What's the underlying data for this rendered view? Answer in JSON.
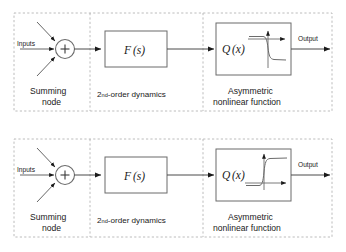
{
  "figure": {
    "panels": [
      {
        "id": "top",
        "name": "block-diagram-top"
      },
      {
        "id": "bottom",
        "name": "block-diagram-bottom"
      }
    ]
  },
  "diagram": {
    "input_label": "Inputs",
    "output_label": "Output",
    "summing_node": {
      "symbol": "+",
      "caption_line1": "Summing",
      "caption_line2": "node"
    },
    "dynamics_block": {
      "label_fn": "F",
      "label_arg": "(s)",
      "caption_prefix": "2",
      "caption_ordinal": "nd",
      "caption_suffix": "-order dynamics"
    },
    "nonlinear_block": {
      "label_fn": "Q",
      "label_arg": "(x)",
      "caption_line1": "Asymmetric",
      "caption_line2": "nonlinear function",
      "inset": {
        "name": "asymmetric-sigmoid-curve",
        "shape": "sigmoid",
        "description": "steep transition at origin with saturation"
      }
    }
  },
  "colors": {
    "background": "#ffffff",
    "line": "#4a4a4a",
    "box_stroke": "#6b6b6b",
    "dashed_group": "#b4b4b4",
    "text": "#1a1a1a"
  }
}
